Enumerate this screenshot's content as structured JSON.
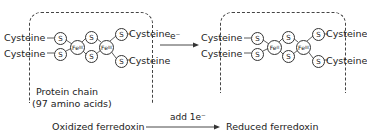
{
  "left_cluster": {
    "state": "oxidized",
    "ligands": [
      "Cysteine",
      "Cysteine",
      "Cysteine",
      "Cysteine"
    ],
    "sulfur_label": "S",
    "iron_1": {
      "symbol": "Fe",
      "oxidation": "III"
    },
    "iron_2": {
      "symbol": "Fe",
      "oxidation": "III"
    },
    "protein_label_1": "Protein chain",
    "protein_label_2": "(97 amino acids)"
  },
  "right_cluster": {
    "state": "reduced",
    "ligands": [
      "Cysteine",
      "Cysteine",
      "Cysteine",
      "Cysteine"
    ],
    "sulfur_label": "S",
    "iron_1": {
      "symbol": "Fe",
      "oxidation": "II"
    },
    "iron_2": {
      "symbol": "Fe",
      "oxidation": "III"
    }
  },
  "middle_arrow": {
    "label": "e⁻"
  },
  "reaction": {
    "reactant": "Oxidized ferredoxin",
    "arrow_label": "add 1e⁻",
    "product": "Reduced ferredoxin"
  }
}
